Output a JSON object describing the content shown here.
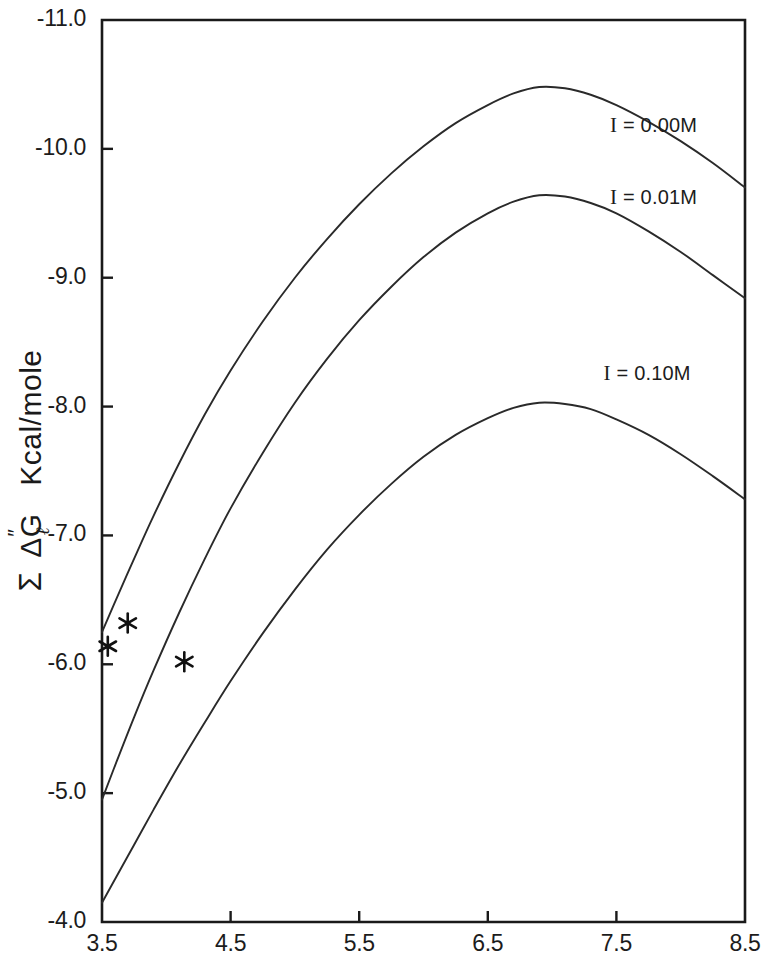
{
  "chart_data": {
    "type": "line",
    "title": "",
    "xlabel": "",
    "ylabel": "Σ ΔG″ₗ Kcal/mole",
    "ylabel_parts": {
      "sigma": "Σ",
      "delta": "Δ",
      "g": "G",
      "superscript": "″",
      "subscript": "ℓ",
      "units": "Kcal/mole"
    },
    "xlim": [
      3.5,
      8.5
    ],
    "ylim": [
      -4.0,
      -11.0
    ],
    "grid": false,
    "legend_position": "inline-right",
    "xticks": [
      3.5,
      4.5,
      5.5,
      6.5,
      7.5,
      8.5
    ],
    "xtick_labels": [
      "3.5",
      "4.5",
      "5.5",
      "6.5",
      "7.5",
      "8.5"
    ],
    "yticks": [
      -11.0,
      -10.0,
      -9.0,
      -8.0,
      -7.0,
      -6.0,
      -5.0,
      -4.0
    ],
    "ytick_labels": [
      "-11.0",
      "-10.0",
      "-9.0",
      "-8.0",
      "-7.0",
      "-6.0",
      "-5.0",
      "-4.0"
    ],
    "series": [
      {
        "name": "I = 0.00M",
        "label": "I = 0.00M",
        "label_x": 7.45,
        "label_y": -10.18,
        "color": "#2a2a2a",
        "x": [
          3.5,
          3.6,
          3.75,
          3.9,
          4.1,
          4.3,
          4.5,
          4.75,
          5.0,
          5.25,
          5.5,
          5.75,
          6.0,
          6.25,
          6.5,
          6.7,
          6.9,
          7.1,
          7.3,
          7.5,
          7.75,
          8.0,
          8.25,
          8.5
        ],
        "y": [
          -6.25,
          -6.48,
          -6.82,
          -7.15,
          -7.56,
          -7.94,
          -8.28,
          -8.66,
          -9.0,
          -9.3,
          -9.57,
          -9.81,
          -10.02,
          -10.2,
          -10.34,
          -10.43,
          -10.48,
          -10.47,
          -10.42,
          -10.34,
          -10.21,
          -10.06,
          -9.89,
          -9.7
        ]
      },
      {
        "name": "I = 0.01M",
        "label": "I = 0.01M",
        "label_x": 7.45,
        "label_y": -9.62,
        "color": "#2a2a2a",
        "x": [
          3.5,
          3.6,
          3.75,
          3.9,
          4.1,
          4.3,
          4.5,
          4.75,
          5.0,
          5.25,
          5.5,
          5.75,
          6.0,
          6.25,
          6.5,
          6.7,
          6.9,
          7.1,
          7.3,
          7.5,
          7.75,
          8.0,
          8.25,
          8.5
        ],
        "y": [
          -4.95,
          -5.21,
          -5.59,
          -5.95,
          -6.4,
          -6.82,
          -7.21,
          -7.64,
          -8.03,
          -8.37,
          -8.67,
          -8.93,
          -9.16,
          -9.35,
          -9.5,
          -9.59,
          -9.64,
          -9.63,
          -9.58,
          -9.5,
          -9.36,
          -9.2,
          -9.02,
          -8.84
        ]
      },
      {
        "name": "I = 0.10M",
        "label": "I = 0.10M",
        "label_x": 7.4,
        "label_y": -8.25,
        "color": "#2a2a2a",
        "x": [
          3.5,
          3.6,
          3.75,
          3.9,
          4.1,
          4.3,
          4.5,
          4.75,
          5.0,
          5.25,
          5.5,
          5.75,
          6.0,
          6.25,
          6.5,
          6.7,
          6.9,
          7.1,
          7.3,
          7.5,
          7.75,
          8.0,
          8.25,
          8.5
        ],
        "y": [
          -4.15,
          -4.33,
          -4.6,
          -4.87,
          -5.22,
          -5.55,
          -5.87,
          -6.24,
          -6.58,
          -6.89,
          -7.16,
          -7.4,
          -7.61,
          -7.78,
          -7.91,
          -7.99,
          -8.03,
          -8.02,
          -7.98,
          -7.9,
          -7.78,
          -7.63,
          -7.46,
          -7.28
        ]
      }
    ],
    "markers": [
      {
        "symbol": "*",
        "x": 3.545,
        "y": -6.14,
        "series": "I = 0.00M"
      },
      {
        "symbol": "*",
        "x": 3.7,
        "y": -6.32,
        "series": "I = 0.01M"
      },
      {
        "symbol": "*",
        "x": 4.14,
        "y": -6.02,
        "series": "I = 0.10M"
      }
    ],
    "axis_color": "#1a1a1a"
  }
}
